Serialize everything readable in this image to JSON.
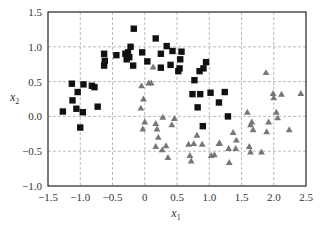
{
  "chart_data": {
    "type": "scatter",
    "title": "",
    "xlabel": "x",
    "xlabel_sub": "1",
    "ylabel": "x",
    "ylabel_sub": "2",
    "xlim": [
      -1.5,
      2.5
    ],
    "ylim": [
      -1.0,
      1.5
    ],
    "xticks": [
      -1.5,
      -1.0,
      -0.5,
      0,
      0.5,
      1.0,
      1.5,
      2.0,
      2.5
    ],
    "xtick_labels": [
      "−1.5",
      "−1.0",
      "−0.5",
      "0",
      "0.5",
      "1.0",
      "1.5",
      "2.0",
      "2.5"
    ],
    "yticks": [
      -1.0,
      -0.5,
      0.0,
      0.5,
      1.0,
      1.5
    ],
    "ytick_labels": [
      "−1.0",
      "−0.5",
      "0.0",
      "0.5",
      "1.0",
      "1.5"
    ],
    "grid": true,
    "legend": null,
    "series": [
      {
        "name": "class 0",
        "marker": "square",
        "color": "#111111",
        "points": [
          [
            -1.13,
            0.47
          ],
          [
            -0.95,
            0.46
          ],
          [
            -0.82,
            0.44
          ],
          [
            -0.78,
            0.42
          ],
          [
            -1.04,
            0.35
          ],
          [
            -1.12,
            0.23
          ],
          [
            -0.73,
            0.14
          ],
          [
            -1.06,
            0.11
          ],
          [
            -1.27,
            0.07
          ],
          [
            -0.96,
            0.06
          ],
          [
            -1.0,
            -0.16
          ],
          [
            -0.17,
            1.26
          ],
          [
            0.17,
            1.12
          ],
          [
            -0.22,
            1.0
          ],
          [
            -0.63,
            0.9
          ],
          [
            -0.44,
            0.88
          ],
          [
            -0.3,
            0.9
          ],
          [
            -0.26,
            0.92
          ],
          [
            -0.24,
            0.85
          ],
          [
            -0.28,
            0.82
          ],
          [
            -0.04,
            0.92
          ],
          [
            -0.62,
            0.8
          ],
          [
            -0.63,
            0.73
          ],
          [
            -0.18,
            0.73
          ],
          [
            0.04,
            0.79
          ],
          [
            0.34,
            1.01
          ],
          [
            0.43,
            0.94
          ],
          [
            0.57,
            0.93
          ],
          [
            0.25,
            0.9
          ],
          [
            0.55,
            0.82
          ],
          [
            0.4,
            0.74
          ],
          [
            0.25,
            0.7
          ],
          [
            0.54,
            0.69
          ],
          [
            0.52,
            0.65
          ],
          [
            0.95,
            0.78
          ],
          [
            0.91,
            0.69
          ],
          [
            0.85,
            0.65
          ],
          [
            0.77,
            0.52
          ],
          [
            0.74,
            0.32
          ],
          [
            0.86,
            0.32
          ],
          [
            1.02,
            0.34
          ],
          [
            1.24,
            0.35
          ],
          [
            1.15,
            0.2
          ],
          [
            0.82,
            0.13
          ],
          [
            1.29,
            0.0
          ],
          [
            0.9,
            -0.14
          ]
        ]
      },
      {
        "name": "class 1",
        "marker": "triangle",
        "color": "#777777",
        "points": [
          [
            0.13,
            0.71
          ],
          [
            0.06,
            0.48
          ],
          [
            0.1,
            0.48
          ],
          [
            -0.05,
            0.44
          ],
          [
            -0.02,
            0.25
          ],
          [
            -0.06,
            0.12
          ],
          [
            0.28,
            -0.01
          ],
          [
            0.46,
            -0.03
          ],
          [
            0.0,
            -0.08
          ],
          [
            0.17,
            -0.1
          ],
          [
            0.42,
            -0.12
          ],
          [
            -0.03,
            -0.18
          ],
          [
            0.19,
            -0.18
          ],
          [
            0.21,
            -0.3
          ],
          [
            0.33,
            -0.42
          ],
          [
            0.17,
            -0.43
          ],
          [
            0.27,
            -0.48
          ],
          [
            0.36,
            -0.59
          ],
          [
            0.81,
            -0.27
          ],
          [
            0.68,
            -0.4
          ],
          [
            0.76,
            -0.39
          ],
          [
            0.89,
            -0.4
          ],
          [
            0.7,
            -0.56
          ],
          [
            0.72,
            -0.64
          ],
          [
            1.03,
            -0.56
          ],
          [
            1.08,
            -0.55
          ],
          [
            1.15,
            -0.39
          ],
          [
            1.37,
            -0.23
          ],
          [
            1.42,
            -0.34
          ],
          [
            1.16,
            -0.38
          ],
          [
            1.3,
            -0.46
          ],
          [
            1.41,
            -0.46
          ],
          [
            1.31,
            -0.66
          ],
          [
            1.62,
            -0.43
          ],
          [
            1.64,
            -0.51
          ],
          [
            1.81,
            -0.51
          ],
          [
            1.59,
            0.06
          ],
          [
            1.66,
            -0.08
          ],
          [
            1.64,
            -0.12
          ],
          [
            1.68,
            -0.19
          ],
          [
            1.89,
            -0.22
          ],
          [
            1.92,
            -0.08
          ],
          [
            2.04,
            0.06
          ],
          [
            2.06,
            -0.02
          ],
          [
            2.24,
            -0.19
          ],
          [
            1.88,
            0.63
          ],
          [
            1.99,
            0.33
          ],
          [
            2.0,
            0.27
          ],
          [
            2.12,
            0.32
          ],
          [
            2.42,
            0.33
          ]
        ]
      }
    ]
  },
  "layout": {
    "plot_left": 48,
    "plot_top": 12,
    "plot_right": 306,
    "plot_bottom": 186
  }
}
